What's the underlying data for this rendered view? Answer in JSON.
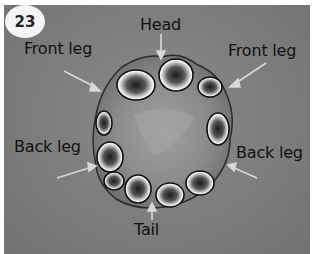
{
  "figure": {
    "step_number": "23",
    "labels": {
      "head": "Head",
      "front_leg_left": "Front leg",
      "front_leg_right": "Front leg",
      "back_leg_left": "Back leg",
      "back_leg_right": "Back leg",
      "tail": "Tail"
    },
    "colors": {
      "background": "#7d7d7d",
      "border": "#ffffff",
      "badge": "#f4f4f4",
      "arrow": "#d8d8d8",
      "text": "#111111"
    }
  }
}
